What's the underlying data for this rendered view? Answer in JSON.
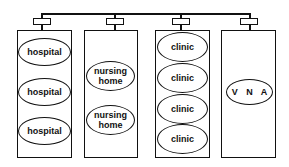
{
  "diagram": {
    "type": "network-hierarchy",
    "groups": [
      {
        "name": "hospitals",
        "members": [
          "hospital",
          "hospital",
          "hospital"
        ]
      },
      {
        "name": "nursing-homes",
        "members": [
          "nursing\nhome",
          "nursing\nhome"
        ]
      },
      {
        "name": "clinics",
        "members": [
          "clinic",
          "clinic",
          "clinic",
          "clinic"
        ]
      },
      {
        "name": "vna",
        "members": [
          "V N A"
        ]
      }
    ]
  }
}
